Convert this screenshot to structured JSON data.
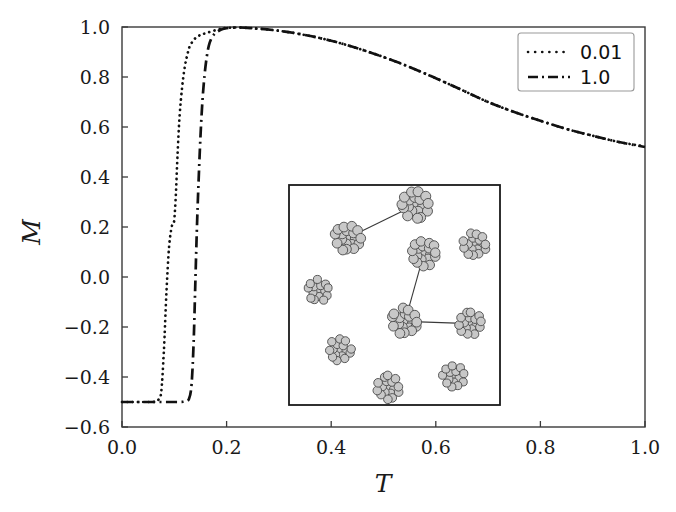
{
  "chart_data": {
    "type": "line",
    "title": "",
    "xlabel": "T",
    "ylabel": "M",
    "xlim": [
      0.0,
      1.0
    ],
    "ylim": [
      -0.6,
      1.0
    ],
    "xticks": [
      "0.0",
      "0.2",
      "0.4",
      "0.6",
      "0.8",
      "1.0"
    ],
    "xtick_values": [
      0.0,
      0.2,
      0.4,
      0.6,
      0.8,
      1.0
    ],
    "yticks": [
      "1.0",
      "0.8",
      "0.6",
      "0.4",
      "0.2",
      "0.0",
      "-0.2",
      "-0.4",
      "-0.6"
    ],
    "ytick_values": [
      1.0,
      0.8,
      0.6,
      0.4,
      0.2,
      0.0,
      -0.2,
      -0.4,
      -0.6
    ],
    "grid": false,
    "legend_position": "upper right",
    "series": [
      {
        "name": "0.01",
        "linestyle": "dotted",
        "color": "#111111",
        "x": [
          0.0,
          0.01,
          0.02,
          0.03,
          0.04,
          0.05,
          0.06,
          0.065,
          0.07,
          0.075,
          0.08,
          0.085,
          0.09,
          0.095,
          0.098,
          0.1,
          0.103,
          0.106,
          0.11,
          0.115,
          0.12,
          0.125,
          0.13,
          0.14,
          0.15,
          0.16,
          0.175,
          0.19,
          0.2,
          0.22,
          0.25,
          0.3,
          0.35,
          0.4,
          0.45,
          0.5,
          0.55,
          0.6,
          0.65,
          0.7,
          0.75,
          0.8,
          0.85,
          0.9,
          0.95,
          1.0
        ],
        "y": [
          -0.5,
          -0.5,
          -0.5,
          -0.5,
          -0.5,
          -0.5,
          -0.5,
          -0.498,
          -0.49,
          -0.46,
          -0.3,
          -0.06,
          0.12,
          0.2,
          0.215,
          0.23,
          0.33,
          0.48,
          0.64,
          0.76,
          0.84,
          0.89,
          0.925,
          0.955,
          0.968,
          0.975,
          0.985,
          0.993,
          0.996,
          0.998,
          0.995,
          0.985,
          0.968,
          0.945,
          0.915,
          0.88,
          0.84,
          0.795,
          0.748,
          0.7,
          0.66,
          0.625,
          0.592,
          0.565,
          0.54,
          0.522
        ]
      },
      {
        "name": "1.0",
        "linestyle": "dashdot",
        "color": "#111111",
        "x": [
          0.0,
          0.02,
          0.04,
          0.06,
          0.08,
          0.1,
          0.11,
          0.12,
          0.128,
          0.133,
          0.137,
          0.14,
          0.143,
          0.146,
          0.15,
          0.154,
          0.158,
          0.162,
          0.166,
          0.17,
          0.175,
          0.18,
          0.19,
          0.2,
          0.22,
          0.25,
          0.3,
          0.35,
          0.4,
          0.45,
          0.5,
          0.55,
          0.6,
          0.65,
          0.7,
          0.75,
          0.8,
          0.85,
          0.9,
          0.95,
          1.0
        ],
        "y": [
          -0.5,
          -0.5,
          -0.5,
          -0.5,
          -0.5,
          -0.5,
          -0.5,
          -0.498,
          -0.488,
          -0.43,
          -0.26,
          -0.04,
          0.18,
          0.36,
          0.56,
          0.71,
          0.81,
          0.88,
          0.925,
          0.95,
          0.968,
          0.978,
          0.99,
          0.995,
          0.998,
          0.995,
          0.985,
          0.968,
          0.945,
          0.915,
          0.88,
          0.84,
          0.795,
          0.748,
          0.7,
          0.66,
          0.625,
          0.592,
          0.565,
          0.54,
          0.52
        ]
      }
    ],
    "inset": {
      "description": "snapshot of nanoparticle clusters, some linked by bonds",
      "border_color": "#1a1a1a",
      "background": "#ffffff",
      "cluster_fill": "#c8c8c8",
      "cluster_stroke": "#4a4a4a",
      "clusters": [
        {
          "cx": 0.6,
          "cy": 0.09,
          "r": 0.072,
          "beads": 19
        },
        {
          "cx": 0.28,
          "cy": 0.24,
          "r": 0.07,
          "beads": 19
        },
        {
          "cx": 0.88,
          "cy": 0.27,
          "r": 0.062,
          "beads": 17
        },
        {
          "cx": 0.64,
          "cy": 0.31,
          "r": 0.068,
          "beads": 19
        },
        {
          "cx": 0.14,
          "cy": 0.48,
          "r": 0.058,
          "beads": 15
        },
        {
          "cx": 0.55,
          "cy": 0.62,
          "r": 0.07,
          "beads": 19
        },
        {
          "cx": 0.86,
          "cy": 0.63,
          "r": 0.062,
          "beads": 17
        },
        {
          "cx": 0.24,
          "cy": 0.75,
          "r": 0.06,
          "beads": 16
        },
        {
          "cx": 0.78,
          "cy": 0.87,
          "r": 0.058,
          "beads": 15
        },
        {
          "cx": 0.47,
          "cy": 0.92,
          "r": 0.062,
          "beads": 17
        }
      ],
      "bonds": [
        {
          "from": 1,
          "to": 0
        },
        {
          "from": 3,
          "to": 5
        },
        {
          "from": 5,
          "to": 6
        }
      ]
    }
  },
  "legend": {
    "entries": [
      {
        "label": "0.01",
        "style": "dotted"
      },
      {
        "label": "1.0",
        "style": "dashdot"
      }
    ]
  },
  "axes": {
    "x_title": "T",
    "y_title": "M"
  }
}
